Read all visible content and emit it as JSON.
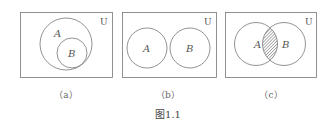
{
  "figure": {
    "title": "图1.1",
    "universe_label": "U",
    "panels": [
      {
        "caption": "（a）",
        "set_a_label": "A",
        "set_b_label": "B",
        "relation": "B subset of A"
      },
      {
        "caption": "（b）",
        "set_a_label": "A",
        "set_b_label": "B",
        "relation": "A and B disjoint"
      },
      {
        "caption": "（c）",
        "set_a_label": "A",
        "set_b_label": "B",
        "relation": "A and B overlap, intersection shaded"
      }
    ],
    "colors": {
      "stroke": "#777777",
      "text": "#555555",
      "hatch": "#555555"
    }
  }
}
